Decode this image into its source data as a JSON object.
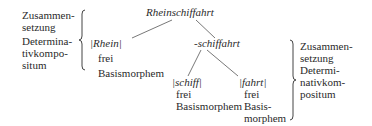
{
  "diagram": {
    "root": "Rheinschiffahrt",
    "left_label": {
      "lines": [
        "Zusammen-",
        "setzung",
        "Determina-",
        "tivkompo-",
        "situm"
      ]
    },
    "right_label": {
      "lines": [
        "Zusammen-",
        "setzung",
        "Determi-",
        "nativkom-",
        "positum"
      ]
    },
    "nodes": {
      "rhein": {
        "label": "|Rhein|",
        "type1": "frei",
        "type2": "Basismorphem"
      },
      "schiffahrt": {
        "label": "-schiffahrt"
      },
      "schiff": {
        "label": "|schiff|",
        "type1": "frei",
        "type2": "Basismorphem"
      },
      "fahrt": {
        "label": "|fahrt|",
        "type1": "frei",
        "type2a": "Basis-",
        "type2b": "morphem"
      }
    }
  }
}
